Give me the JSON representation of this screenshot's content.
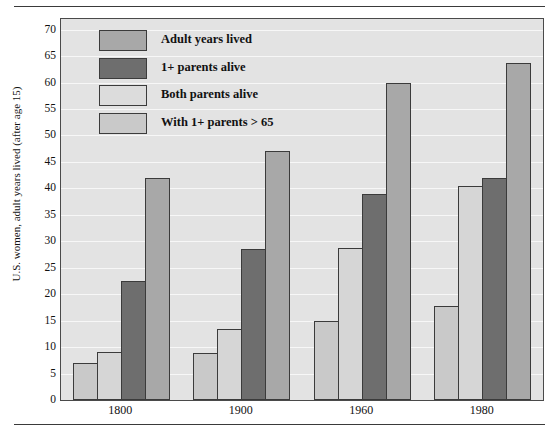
{
  "chart_data": {
    "type": "bar",
    "title": "",
    "subtitle": "",
    "xlabel": "",
    "ylabel": "U.S. women, adult years lived (after age 15)",
    "categories": [
      "1800",
      "1900",
      "1960",
      "1980"
    ],
    "series": [
      {
        "name": "With 1+ parents > 65",
        "key": "with_parents_over_65",
        "color": "#c9c9c9",
        "values": [
          7.0,
          8.8,
          15.0,
          17.7
        ]
      },
      {
        "name": "Both parents alive",
        "key": "both_parents_alive",
        "color": "#d6d6d6",
        "values": [
          9.0,
          13.5,
          28.8,
          40.5
        ]
      },
      {
        "name": "1+ parents alive",
        "key": "one_plus_parents_alive",
        "color": "#6e6e6e",
        "values": [
          22.5,
          28.5,
          39.0,
          42.0
        ]
      },
      {
        "name": "Adult years lived",
        "key": "adult_years_lived",
        "color": "#a8a8a8",
        "values": [
          42.0,
          47.0,
          60.0,
          63.7
        ]
      }
    ],
    "ylim": [
      0,
      72
    ],
    "yticks": [
      0,
      5,
      10,
      15,
      20,
      25,
      30,
      35,
      40,
      45,
      50,
      55,
      60,
      65,
      70
    ],
    "ytick_labels": [
      "0",
      "5",
      "10",
      "15",
      "20",
      "25",
      "30",
      "35",
      "40",
      "45",
      "50",
      "55",
      "60",
      "65",
      "70"
    ],
    "grid": true,
    "grid_color": "#f7f7f7",
    "legend_position": "top-left",
    "plot_background": "#e3e3e3",
    "border_color": "#4a4a4a"
  },
  "legend": {
    "items": [
      {
        "label": "Adult years lived",
        "color": "#a8a8a8"
      },
      {
        "label": "1+ parents alive",
        "color": "#6e6e6e"
      },
      {
        "label": "Both parents alive",
        "color": "#dcdcdc"
      },
      {
        "label": "With 1+ parents > 65",
        "color": "#c9c9c9"
      }
    ]
  }
}
